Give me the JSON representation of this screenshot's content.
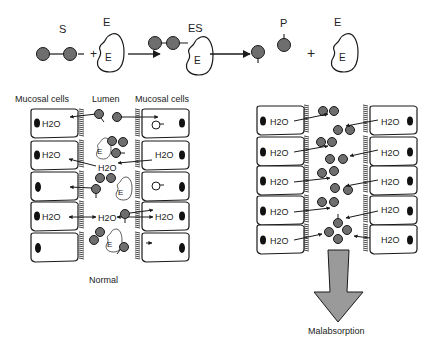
{
  "reaction": {
    "substrate_label": "S",
    "enzyme_label": "E",
    "complex_label": "ES",
    "product_label": "P",
    "enzyme_inner_label": "E",
    "plus": "+"
  },
  "normal_panel": {
    "left_header": "Mucosal cells",
    "center_header": "Lumen",
    "right_header": "Mucosal cells",
    "water_label": "H2O",
    "enzyme_label": "E",
    "caption": "Normal"
  },
  "malabsorption_panel": {
    "water_label": "H2O",
    "caption": "Malabsorption"
  },
  "colors": {
    "molecule_fill": "#6e6e6e",
    "outline": "#1a1a1a",
    "arrow_fill": "#9a9a9a",
    "nucleus": "#111111"
  }
}
